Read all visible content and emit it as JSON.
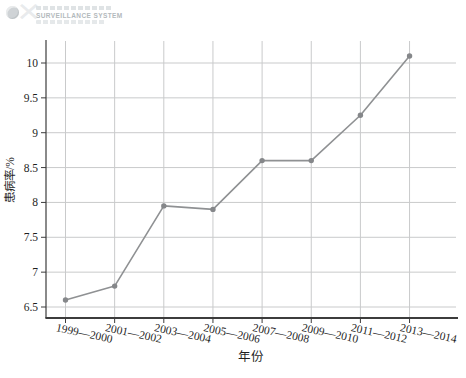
{
  "watermark": {
    "title": "SURVEILLANCE SYSTEM",
    "logo_icon": "globe-icon",
    "cross_icon": "x-mark-icon"
  },
  "chart_data": {
    "type": "line",
    "title": "",
    "categories": [
      "1999—2000",
      "2001—2002",
      "2003—2004",
      "2005—2006",
      "2007—2008",
      "2009—2010",
      "2011—2012",
      "2013—2014"
    ],
    "values": [
      6.6,
      6.8,
      7.95,
      7.9,
      8.6,
      8.6,
      9.25,
      10.1
    ],
    "series": [
      {
        "name": "患病率",
        "values": [
          6.6,
          6.8,
          7.95,
          7.9,
          8.6,
          8.6,
          9.25,
          10.1
        ]
      }
    ],
    "xlabel": "年份",
    "ylabel": "患病率/%",
    "ylim": [
      6.5,
      10
    ],
    "yticks": [
      6.5,
      7,
      7.5,
      8,
      8.5,
      9,
      9.5,
      10
    ],
    "grid": true,
    "legend_position": "none",
    "colors": {
      "line": "#8f9193",
      "marker": "#85878a",
      "grid": "#c9cacb",
      "axis": "#3c3c3c",
      "text": "#1f1f1f"
    }
  }
}
